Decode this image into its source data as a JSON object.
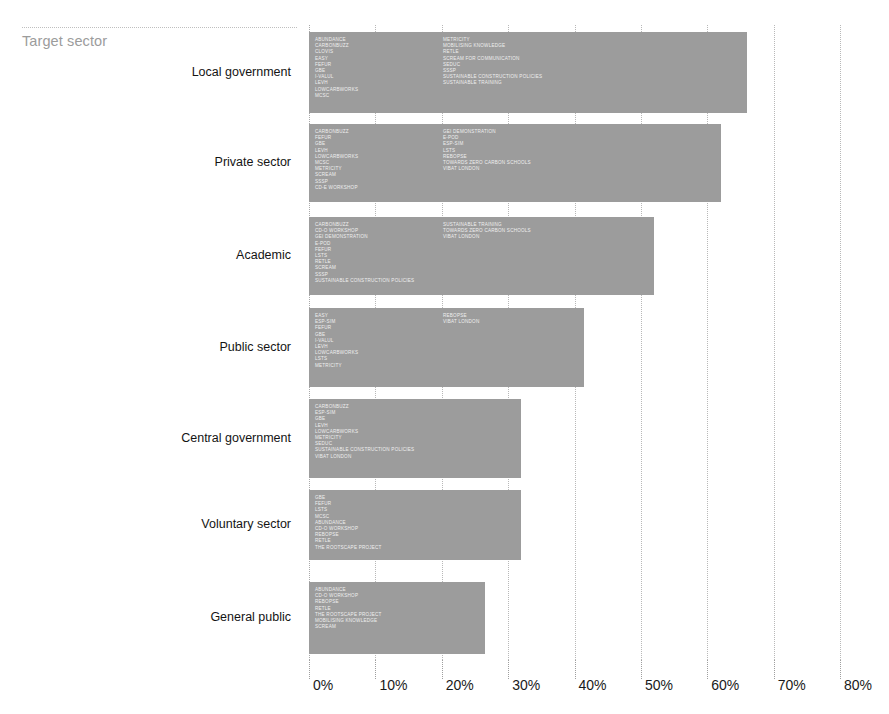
{
  "header": {
    "title": "Target sector"
  },
  "chart_data": {
    "type": "bar",
    "orientation": "horizontal",
    "title": "Target sector",
    "xlabel": "",
    "ylabel": "",
    "xlim": [
      0,
      80
    ],
    "xunit": "%",
    "grid": true,
    "legend": "none",
    "bar_color": "#9c9c9c",
    "tick_labels": [
      "0%",
      "10%",
      "20%",
      "30%",
      "40%",
      "50%",
      "60%",
      "70%",
      "80%"
    ],
    "tick_values": [
      0,
      10,
      20,
      30,
      40,
      50,
      60,
      70,
      80
    ],
    "categories": [
      "Local government",
      "Private sector",
      "Academic",
      "Public sector",
      "Central government",
      "Voluntary sector",
      "General public"
    ],
    "values": [
      66,
      62,
      52,
      41.5,
      32,
      32,
      26.5
    ],
    "bars": [
      {
        "category": "Local government",
        "value": 66,
        "projects_col_a": [
          "ABUNDANCE",
          "CARBONBUZZ",
          "CLOVIS",
          "EASY",
          "FEFUR",
          "GBE",
          "I-VALUL",
          "LEVH",
          "LOWCARBWORKS",
          "MCSC"
        ],
        "projects_col_b": [
          "METRICITY",
          "MOBILISING KNOWLEDGE",
          "RETLE",
          "SCREAM FOR COMMUNICATION",
          "SEDUC",
          "SSSP",
          "SUSTAINABLE CONSTRUCTION POLICIES",
          "SUSTAINABLE TRAINING"
        ]
      },
      {
        "category": "Private sector",
        "value": 62,
        "projects_col_a": [
          "CARBONBUZZ",
          "FEFUR",
          "GBE",
          "LEVH",
          "LOWCARBWORKS",
          "MCSC",
          "METRICITY",
          "SCREAM",
          "SSSP",
          "CD-E WORKSHOP"
        ],
        "projects_col_b": [
          "GEI DEMONSTRATION",
          "E-POD",
          "ESP-SIM",
          "LSTS",
          "REBOPSE",
          "TOWARDS ZERO CARBON SCHOOLS",
          "VIBAT LONDON"
        ]
      },
      {
        "category": "Academic",
        "value": 52,
        "projects_col_a": [
          "CARBONBUZZ",
          "CD-O WORKSHOP",
          "GEI DEMONSTRATION",
          "E-POD",
          "FEFUR",
          "LSTS",
          "RETLE",
          "SCREAM",
          "SSSP",
          "SUSTAINABLE CONSTRUCTION POLICIES"
        ],
        "projects_col_b": [
          "SUSTAINABLE TRAINING",
          "TOWARDS ZERO CARBON SCHOOLS",
          "VIBAT LONDON"
        ]
      },
      {
        "category": "Public sector",
        "value": 41.5,
        "projects_col_a": [
          "EASY",
          "ESP-SIM",
          "FEFUR",
          "GBE",
          "I-VALUL",
          "LEVH",
          "LOWCARBWORKS",
          "LSTS",
          "METRICITY"
        ],
        "projects_col_b": [
          "REBOPSE",
          "VIBAT LONDON"
        ]
      },
      {
        "category": "Central government",
        "value": 32,
        "projects_col_a": [
          "CARBONBUZZ",
          "ESP-SIM",
          "GBE",
          "LEVH",
          "LOWCARBWORKS",
          "METRICITY",
          "SEDUC",
          "SUSTAINABLE CONSTRUCTION POLICIES",
          "VIBAT LONDON"
        ],
        "projects_col_b": []
      },
      {
        "category": "Voluntary sector",
        "value": 32,
        "projects_col_a": [
          "GBE",
          "FEFUR",
          "LSTS",
          "MCSC",
          "ABUNDANCE",
          "CD-O WORKSHOP",
          "REBOPSE",
          "RETLE",
          "THE ROOTSCAPE PROJECT"
        ],
        "projects_col_b": []
      },
      {
        "category": "General public",
        "value": 26.5,
        "projects_col_a": [
          "ABUNDANCE",
          "CD-O WORKSHOP",
          "REBOPSE",
          "RETLE",
          "THE ROOTSCAPE PROJECT",
          "MOBILISING KNOWLEDGE",
          "SCREAM"
        ],
        "projects_col_b": []
      }
    ]
  }
}
